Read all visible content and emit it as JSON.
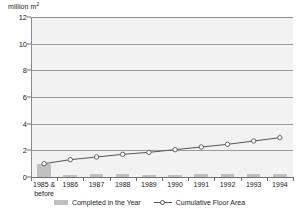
{
  "chart_data": {
    "type": "bar",
    "title": "",
    "ylabel": "million m²",
    "xlabel": "",
    "categories": [
      "1985 & before",
      "1986",
      "1987",
      "1988",
      "1989",
      "1990",
      "1991",
      "1992",
      "1993",
      "1994"
    ],
    "ylim": [
      0,
      12
    ],
    "yticks": [
      0,
      2,
      4,
      6,
      8,
      10,
      12
    ],
    "grid": true,
    "legend_position": "bottom",
    "series": [
      {
        "name": "Completed in the Year",
        "type": "bar",
        "color": "#c0c0c0",
        "values": [
          1.0,
          0.18,
          0.2,
          0.2,
          0.15,
          0.18,
          0.2,
          0.2,
          0.22,
          0.22
        ]
      },
      {
        "name": "Cumulative Floor Area",
        "type": "line",
        "color": "#555555",
        "marker": "circle-open",
        "values": [
          1.0,
          1.3,
          1.5,
          1.7,
          1.85,
          2.05,
          2.25,
          2.45,
          2.7,
          2.95
        ]
      }
    ]
  },
  "axis": {
    "y_title_main": "million m",
    "y_title_sup": "2",
    "y_tick_labels": [
      "12",
      "10",
      "8",
      "6",
      "4",
      "2",
      "0"
    ]
  },
  "xlabels": [
    {
      "line1": "1985 &",
      "line2": "before"
    },
    {
      "line1": "1986",
      "line2": ""
    },
    {
      "line1": "1987",
      "line2": ""
    },
    {
      "line1": "1988",
      "line2": ""
    },
    {
      "line1": "1989",
      "line2": ""
    },
    {
      "line1": "1990",
      "line2": ""
    },
    {
      "line1": "1991",
      "line2": ""
    },
    {
      "line1": "1992",
      "line2": ""
    },
    {
      "line1": "1993",
      "line2": ""
    },
    {
      "line1": "1994",
      "line2": ""
    }
  ],
  "legend": {
    "items": [
      {
        "label": "Completed in the Year",
        "style": "bar",
        "color": "#c0c0c0"
      },
      {
        "label": "Cumulative Floor Area",
        "style": "line",
        "color": "#555555"
      }
    ]
  },
  "colors": {
    "plot_background": "#f2f2f2",
    "gridline": "#9a9a9a",
    "axis": "#6e6e6e",
    "bar": "#c0c0c0",
    "line": "#555555",
    "text": "#1a1a1a"
  }
}
